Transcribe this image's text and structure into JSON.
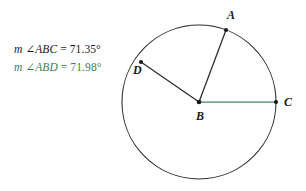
{
  "canvas": {
    "width": 306,
    "height": 191,
    "background": "#ffffff"
  },
  "colors": {
    "stroke": "#2b2b2b",
    "black_text": "#1a1a1a",
    "green": "#3f7d52",
    "green_segment": "#4a8a5c"
  },
  "measures": {
    "abc": {
      "prefix": "m",
      "angle_symbol": "∠",
      "name": "ABC",
      "equals": "=",
      "value": "71.35°",
      "color": "#1a1a1a"
    },
    "abd": {
      "prefix": "m",
      "angle_symbol": "∠",
      "name": "ABD",
      "equals": "=",
      "value": "71.98°",
      "color": "#3f7d52"
    }
  },
  "figure": {
    "circle": {
      "cx": 199,
      "cy": 102,
      "r": 77
    },
    "points": [
      {
        "id": "A",
        "label": "A",
        "x": 226,
        "y": 30,
        "label_x": 227,
        "label_y": 9
      },
      {
        "id": "B",
        "label": "B",
        "x": 199,
        "y": 102,
        "label_x": 196,
        "label_y": 110
      },
      {
        "id": "C",
        "label": "C",
        "x": 276,
        "y": 102,
        "label_x": 284,
        "label_y": 96
      },
      {
        "id": "D",
        "label": "D",
        "x": 141,
        "y": 62,
        "label_x": 133,
        "label_y": 64
      }
    ],
    "segments": [
      {
        "id": "BA",
        "from": "B",
        "to": "A",
        "color": "#2b2b2b"
      },
      {
        "id": "BD",
        "from": "B",
        "to": "D",
        "color": "#2b2b2b"
      },
      {
        "id": "BC",
        "from": "B",
        "to": "C",
        "color": "#4a8a5c"
      }
    ]
  }
}
